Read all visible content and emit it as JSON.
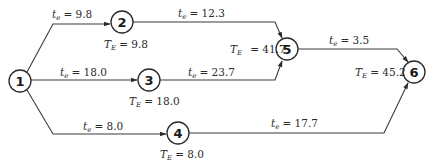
{
  "diagram": {
    "type": "PERT network",
    "nodes": [
      {
        "id": "1",
        "label": "1",
        "x": 20,
        "y": 81
      },
      {
        "id": "2",
        "label": "2",
        "x": 122,
        "y": 22,
        "te_label": "T",
        "te_sub": "E",
        "te_value": "= 9.8"
      },
      {
        "id": "3",
        "label": "3",
        "x": 149,
        "y": 80,
        "te_label": "T",
        "te_sub": "E",
        "te_value": "= 18.0"
      },
      {
        "id": "4",
        "label": "4",
        "x": 178,
        "y": 133,
        "te_label": "T",
        "te_sub": "E",
        "te_value": "= 8.0"
      },
      {
        "id": "5",
        "label": "5",
        "x": 287,
        "y": 49,
        "te_label": "T",
        "te_sub": "E",
        "te_value": "= 41.7"
      },
      {
        "id": "6",
        "label": "6",
        "x": 414,
        "y": 72,
        "te_label": "T",
        "te_sub": "E",
        "te_value": "= 45.2"
      }
    ],
    "edges": [
      {
        "from": "1",
        "to": "2",
        "t_label": "t",
        "t_sub": "e",
        "t_value": "= 9.8"
      },
      {
        "from": "1",
        "to": "3",
        "t_label": "t",
        "t_sub": "e",
        "t_value": "= 18.0"
      },
      {
        "from": "1",
        "to": "4",
        "t_label": "t",
        "t_sub": "e",
        "t_value": "= 8.0"
      },
      {
        "from": "2",
        "to": "5",
        "t_label": "t",
        "t_sub": "e",
        "t_value": "= 12.3"
      },
      {
        "from": "3",
        "to": "5",
        "t_label": "t",
        "t_sub": "e",
        "t_value": "= 23.7"
      },
      {
        "from": "5",
        "to": "6",
        "t_label": "t",
        "t_sub": "e",
        "t_value": "= 3.5"
      },
      {
        "from": "4",
        "to": "6",
        "t_label": "t",
        "t_sub": "e",
        "t_value": "= 17.7"
      }
    ]
  }
}
